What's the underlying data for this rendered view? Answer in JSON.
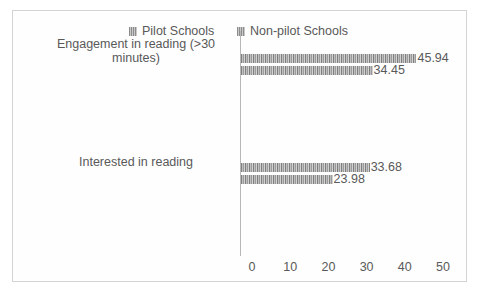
{
  "chart_data": {
    "type": "bar",
    "orientation": "horizontal",
    "title": "",
    "xlabel": "",
    "ylabel": "",
    "xlim": [
      0,
      50
    ],
    "xticks": [
      "0",
      "10",
      "20",
      "30",
      "40",
      "50"
    ],
    "grid": false,
    "legend_position": "top",
    "categories": [
      "Engagement in reading (>30 minutes)",
      "Interested in reading"
    ],
    "category_lines": [
      [
        "Engagement in reading (>30",
        "minutes)"
      ],
      [
        "Interested in reading"
      ]
    ],
    "series": [
      {
        "name": "Pilot Schools",
        "values": [
          45.94,
          33.68
        ],
        "labels": [
          "45.94",
          "33.68"
        ]
      },
      {
        "name": "Non-pilot Schools",
        "values": [
          34.45,
          23.98
        ],
        "labels": [
          "34.45",
          "23.98"
        ]
      }
    ]
  },
  "legend": {
    "items": [
      {
        "label": "Pilot Schools",
        "swatch": "hatched-gray-square"
      },
      {
        "label": "Non-pilot Schools",
        "swatch": "hatched-gray-square"
      }
    ]
  },
  "colors": {
    "bar_dark": "#7f7f7f",
    "bar_light": "#bfbfbf",
    "text": "#595959",
    "axis": "#b7b7b7",
    "border": "#d4d4d4",
    "background": "#ffffff"
  }
}
